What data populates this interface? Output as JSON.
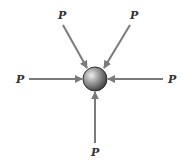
{
  "diagram": {
    "colors": {
      "arrow": "#7a7a7a",
      "sphere_light": "#e6e6e6",
      "sphere_dark": "#4a4a4a",
      "label": "#333333"
    },
    "sphere": {
      "cx": 95,
      "cy": 79,
      "r": 12
    },
    "forces": [
      {
        "id": "top-left",
        "label": "P",
        "label_x": 58,
        "label_y": 19,
        "x1": 63,
        "y1": 25,
        "x2": 87,
        "y2": 68
      },
      {
        "id": "top-right",
        "label": "P",
        "label_x": 130,
        "label_y": 19,
        "x1": 130,
        "y1": 25,
        "x2": 104,
        "y2": 68
      },
      {
        "id": "left",
        "label": "P",
        "label_x": 16,
        "label_y": 83,
        "x1": 29,
        "y1": 79,
        "x2": 82,
        "y2": 79
      },
      {
        "id": "right",
        "label": "P",
        "label_x": 168,
        "label_y": 83,
        "x1": 163,
        "y1": 79,
        "x2": 108,
        "y2": 79
      },
      {
        "id": "bottom",
        "label": "P",
        "label_x": 91,
        "label_y": 156,
        "x1": 95,
        "y1": 143,
        "x2": 95,
        "y2": 92
      }
    ]
  }
}
